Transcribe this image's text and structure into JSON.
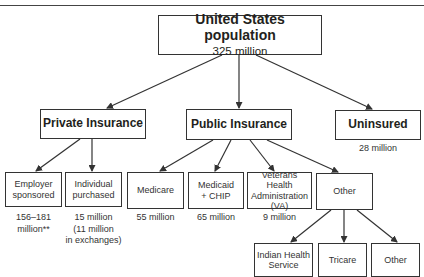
{
  "root": {
    "title": "United States population",
    "value": "325 million"
  },
  "categories": [
    {
      "id": "private",
      "label": "Private Insurance"
    },
    {
      "id": "public",
      "label": "Public Insurance"
    },
    {
      "id": "uninsured",
      "label": "Uninsured",
      "value": "28 million"
    }
  ],
  "private": [
    {
      "label": "Employer sponsored",
      "value_line1": "156–181",
      "value_line2": "million**"
    },
    {
      "label": "Individual purchased",
      "value_line1": "15 million",
      "value_line2": "(11 million",
      "value_line3": "in exchanges)"
    }
  ],
  "public": [
    {
      "label": "Medicare",
      "value": "55 million"
    },
    {
      "label_line1": "Medicaid",
      "label_line2": "+ CHIP",
      "value": "65 million"
    },
    {
      "label_line1": "Veterans Health",
      "label_line2": "Administration",
      "label_line3": "(VA)",
      "value": "9 million"
    },
    {
      "label": "Other"
    }
  ],
  "other": [
    {
      "label_line1": "Indian Health",
      "label_line2": "Service"
    },
    {
      "label": "Tricare"
    },
    {
      "label": "Other"
    }
  ]
}
